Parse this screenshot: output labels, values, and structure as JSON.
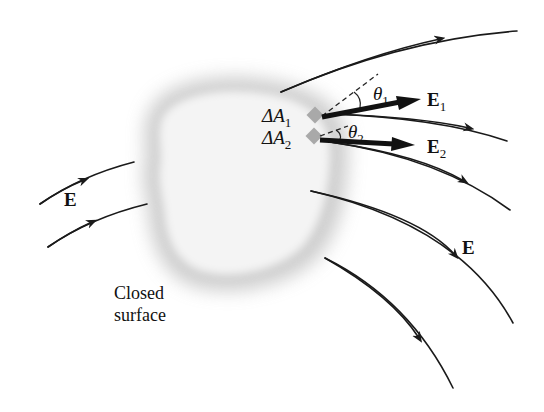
{
  "figure": {
    "caption_line1": "Closed",
    "caption_line2": "surface",
    "field_label": "E",
    "field_label_right": "E",
    "area_elements": [
      {
        "label": "ΔA",
        "subscript": "1"
      },
      {
        "label": "ΔA",
        "subscript": "2"
      }
    ],
    "vectors": [
      {
        "label": "E",
        "subscript": "1"
      },
      {
        "label": "E",
        "subscript": "2"
      }
    ],
    "angles": [
      {
        "label": "θ",
        "subscript": "1"
      },
      {
        "label": "θ",
        "subscript": "2"
      }
    ],
    "colors": {
      "line": "#1a1a1a",
      "surface": "#c8c8c8",
      "patch": "#a9a9a9"
    }
  }
}
